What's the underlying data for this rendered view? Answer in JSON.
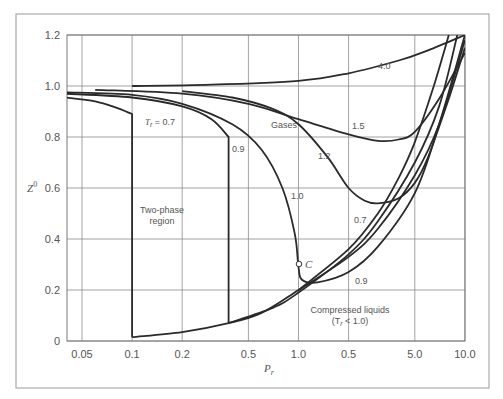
{
  "chart_data": {
    "type": "line",
    "title": "",
    "xlabel": "P_r",
    "ylabel": "Z^0",
    "xscale": "log",
    "xlim": [
      0.04,
      10.0
    ],
    "ylim": [
      0,
      1.2
    ],
    "grid": true,
    "legend": "none (curves labeled inline)",
    "x_ticks": [
      {
        "value": 0.05,
        "label": "0.05"
      },
      {
        "value": 0.1,
        "label": "0.1"
      },
      {
        "value": 0.2,
        "label": "0.2"
      },
      {
        "value": 0.5,
        "label": "0.5"
      },
      {
        "value": 1.0,
        "label": "1.0"
      },
      {
        "value": 2.0,
        "label": "0.5"
      },
      {
        "value": 5.0,
        "label": "5.0"
      },
      {
        "value": 10.0,
        "label": "10.0"
      }
    ],
    "y_ticks": [
      {
        "value": 0,
        "label": "0"
      },
      {
        "value": 0.2,
        "label": "0.2"
      },
      {
        "value": 0.4,
        "label": "0.4"
      },
      {
        "value": 0.6,
        "label": "0.6"
      },
      {
        "value": 0.8,
        "label": "0.8"
      },
      {
        "value": 1.0,
        "label": "1.0"
      },
      {
        "value": 1.2,
        "label": "1.2"
      }
    ],
    "series": [
      {
        "name": "Tr = 4.0",
        "label": "4.0",
        "points": [
          [
            0.1,
            1.0
          ],
          [
            0.3,
            1.005
          ],
          [
            1.0,
            1.02
          ],
          [
            2.0,
            1.05
          ],
          [
            4.0,
            1.1
          ],
          [
            6.0,
            1.14
          ],
          [
            10.0,
            1.2
          ]
        ]
      },
      {
        "name": "Tr = 1.5",
        "label": "1.5",
        "points": [
          [
            0.06,
            0.985
          ],
          [
            0.2,
            0.97
          ],
          [
            0.5,
            0.93
          ],
          [
            1.0,
            0.87
          ],
          [
            2.0,
            0.81
          ],
          [
            3.0,
            0.785
          ],
          [
            4.0,
            0.79
          ],
          [
            5.0,
            0.82
          ],
          [
            7.0,
            0.95
          ],
          [
            10.0,
            1.13
          ]
        ]
      },
      {
        "name": "Tr = 1.2",
        "label": "1.2",
        "points": [
          [
            0.2,
            0.98
          ],
          [
            0.4,
            0.955
          ],
          [
            0.7,
            0.91
          ],
          [
            1.0,
            0.85
          ],
          [
            1.5,
            0.72
          ],
          [
            2.0,
            0.6
          ],
          [
            2.5,
            0.55
          ],
          [
            3.0,
            0.54
          ],
          [
            4.0,
            0.56
          ],
          [
            5.0,
            0.62
          ],
          [
            6.0,
            0.72
          ],
          [
            8.0,
            0.95
          ],
          [
            10.0,
            1.15
          ]
        ]
      },
      {
        "name": "Tr = 1.0",
        "label": "1.0",
        "points": [
          [
            0.04,
            0.975
          ],
          [
            0.1,
            0.965
          ],
          [
            0.2,
            0.93
          ],
          [
            0.4,
            0.85
          ],
          [
            0.6,
            0.75
          ],
          [
            0.8,
            0.6
          ],
          [
            0.95,
            0.42
          ],
          [
            1.0,
            0.29
          ],
          [
            1.05,
            0.24
          ],
          [
            1.3,
            0.23
          ],
          [
            2.0,
            0.27
          ],
          [
            3.0,
            0.37
          ],
          [
            5.0,
            0.58
          ],
          [
            7.0,
            0.85
          ],
          [
            10.0,
            1.2
          ]
        ]
      },
      {
        "name": "Tr = 0.9 (vapor)",
        "label": "0.9",
        "points": [
          [
            0.04,
            0.97
          ],
          [
            0.1,
            0.955
          ],
          [
            0.2,
            0.92
          ],
          [
            0.3,
            0.87
          ],
          [
            0.38,
            0.8
          ],
          [
            0.38,
            0.07
          ]
        ]
      },
      {
        "name": "Tr = 0.7 (vapor)",
        "label": "Tr = 0.7",
        "points": [
          [
            0.04,
            0.955
          ],
          [
            0.06,
            0.94
          ],
          [
            0.08,
            0.915
          ],
          [
            0.1,
            0.89
          ],
          [
            0.1,
            0.015
          ]
        ]
      },
      {
        "name": "Saturated liquid / compressed liquid envelope",
        "label": "",
        "points": [
          [
            0.1,
            0.015
          ],
          [
            0.2,
            0.035
          ],
          [
            0.38,
            0.07
          ],
          [
            0.6,
            0.11
          ],
          [
            1.0,
            0.2
          ],
          [
            2.0,
            0.33
          ],
          [
            3.0,
            0.44
          ],
          [
            5.0,
            0.65
          ],
          [
            7.0,
            0.85
          ],
          [
            10.0,
            1.18
          ]
        ]
      },
      {
        "name": "Tr = 0.9 (liquid)",
        "label": "0.9",
        "points": [
          [
            0.38,
            0.07
          ],
          [
            0.7,
            0.13
          ],
          [
            1.0,
            0.19
          ],
          [
            2.0,
            0.34
          ],
          [
            3.0,
            0.47
          ],
          [
            5.0,
            0.7
          ],
          [
            7.0,
            0.92
          ],
          [
            9.0,
            1.2
          ]
        ]
      },
      {
        "name": "Tr = 0.7 (liquid)",
        "label": "0.7",
        "points": [
          [
            1.0,
            0.2
          ],
          [
            2.0,
            0.36
          ],
          [
            3.0,
            0.5
          ],
          [
            4.0,
            0.64
          ],
          [
            5.0,
            0.78
          ],
          [
            6.5,
            1.0
          ],
          [
            8.0,
            1.2
          ]
        ]
      }
    ],
    "annotations": [
      {
        "text": "Gases",
        "x": 1.15,
        "y": 0.9
      },
      {
        "text": "Two-phase",
        "x": 0.175,
        "y": 0.58
      },
      {
        "text": "region",
        "x": 0.175,
        "y": 0.51
      },
      {
        "text": "Compressed liquids",
        "x": 2.4,
        "y": 0.16
      },
      {
        "text": "(Tr < 1.0)",
        "x": 2.4,
        "y": 0.1
      },
      {
        "text": "C",
        "x": 1.05,
        "y": 0.3,
        "note": "critical point"
      }
    ],
    "critical_point": {
      "label": "C",
      "x": 1.0,
      "y": 0.3
    }
  },
  "labels": {
    "y_axis_title": "Z",
    "y_axis_sup": "0",
    "x_axis_title": "P",
    "x_axis_sub": "r",
    "gases": "Gases",
    "two_phase_1": "Two-phase",
    "two_phase_2": "region",
    "compressed_1": "Compressed liquids",
    "compressed_2": "(T",
    "compressed_2_sub": "r",
    "compressed_2_end": " < 1.0)",
    "crit": "C",
    "tr_prefix": "T",
    "tr_sub": "r",
    "tr_suffix": " = 0.7",
    "curve_4_0": "4.0",
    "curve_1_5": "1.5",
    "curve_1_2": "1.2",
    "curve_1_0": "1.0",
    "curve_0_9_upper": "0.9",
    "curve_0_9_lower": "0.9",
    "curve_0_7_lower": "0.7"
  }
}
